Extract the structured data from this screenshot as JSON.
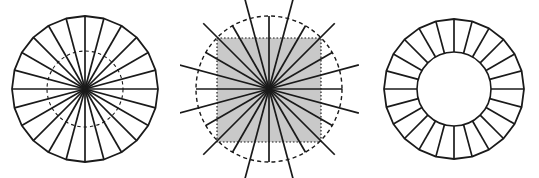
{
  "figure": {
    "canvas": {
      "width": 539,
      "height": 178,
      "background": "#ffffff"
    },
    "stroke_color": "#1a1a1a",
    "shade_color": "#c9c9c9",
    "panels": [
      {
        "id": "panel-a",
        "name": "polygonal-spoked-disc",
        "center": [
          85,
          89
        ],
        "outer_radius": 73,
        "outer_style": "solid-polygon",
        "spoke_count": 24,
        "inner_circle_radius": 38,
        "inner_circle_style": "dashed",
        "has_shaded_square": false,
        "has_hole": false
      },
      {
        "id": "panel-b",
        "name": "dashed-circle-with-shaded-square",
        "center": [
          269,
          89
        ],
        "outer_radius": 73,
        "outer_style": "dashed-circle",
        "spoke_count": 24,
        "spoke_overshoot": 20,
        "square": {
          "x": 217,
          "y": 38,
          "width": 104,
          "height": 104,
          "border_style": "dotted",
          "fill": "#c9c9c9"
        },
        "has_shaded_square": true,
        "has_hole": false
      },
      {
        "id": "panel-c",
        "name": "annulus-radial-segments",
        "center": [
          454,
          89
        ],
        "outer_radius": 70,
        "inner_radius": 37,
        "outer_style": "solid-polygon",
        "spoke_count": 24,
        "has_shaded_square": false,
        "has_hole": true
      }
    ]
  }
}
